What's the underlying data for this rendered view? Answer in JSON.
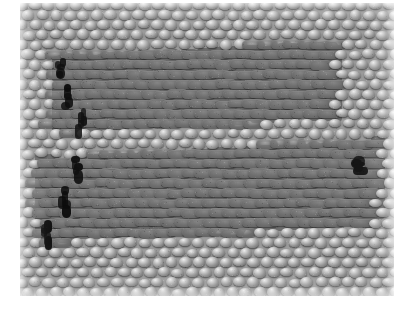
{
  "figure": {
    "kind": "scanning-electron-micrograph",
    "background_color": "#ffffff",
    "caption": "",
    "title": "",
    "labels": [],
    "scale_bar": null,
    "annotations": []
  },
  "frame": {
    "x": 20,
    "y": 3,
    "width": 374,
    "height": 293,
    "base_color": "#9c9c9c"
  },
  "lattice": {
    "type": "hexagonal-close-packed",
    "spacing_x": 13.6,
    "spacing_y": 9.9,
    "row_offset": 6.8,
    "particle_width": 12.4,
    "particle_height": 9.0,
    "rows": 31,
    "cols": 30,
    "normal_particle_color": "#949494",
    "normal_highlight_color": "#ededed",
    "normal_shadow_color": "#3a3a3a",
    "gap_color": "#e4e4e4"
  },
  "bands": [
    {
      "name": "upper-fused-band",
      "fill_color": "#6d6d6d",
      "ridge_color": "#b5b5b5",
      "x_left": 58,
      "x_right": 336,
      "y_top": 56,
      "y_bottom": 132,
      "slant": -14,
      "rows": 7
    },
    {
      "name": "lower-fused-band",
      "fill_color": "#6d6d6d",
      "ridge_color": "#b5b5b5",
      "x_left": 42,
      "x_right": 378,
      "y_top": 158,
      "y_bottom": 242,
      "slant": -18,
      "rows": 8
    }
  ],
  "defects": [
    {
      "name": "crack-upper-left",
      "x": 57,
      "y": 58,
      "w": 9,
      "h": 16,
      "color": "#101010"
    },
    {
      "name": "crack-upper-left-mid",
      "x": 63,
      "y": 84,
      "w": 8,
      "h": 22,
      "color": "#0d0d0d"
    },
    {
      "name": "crack-upper-left-lower",
      "x": 78,
      "y": 108,
      "w": 8,
      "h": 20,
      "color": "#121212"
    },
    {
      "name": "crack-lower-left-top",
      "x": 74,
      "y": 156,
      "w": 9,
      "h": 18,
      "color": "#101010"
    },
    {
      "name": "crack-lower-left-mid",
      "x": 60,
      "y": 186,
      "w": 9,
      "h": 24,
      "color": "#0c0c0c"
    },
    {
      "name": "crack-lower-left-bottom",
      "x": 44,
      "y": 220,
      "w": 10,
      "h": 20,
      "color": "#121212"
    },
    {
      "name": "crack-lower-right",
      "x": 352,
      "y": 156,
      "w": 14,
      "h": 14,
      "color": "#151515"
    }
  ],
  "palette": {
    "white": "#ffffff",
    "light_gray": "#c9c9c9",
    "mid_gray": "#949494",
    "dark_gray": "#6d6d6d",
    "black": "#101010"
  }
}
